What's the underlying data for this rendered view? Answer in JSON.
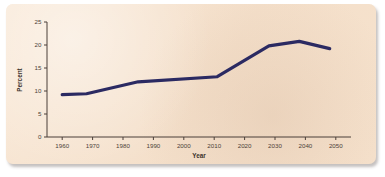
{
  "figure": {
    "background_color": "#ffffff",
    "paper_color": "#f6e2cd",
    "line_color": "#2b2a62",
    "axis_color": "#4a3f38"
  },
  "chart_data": {
    "type": "line",
    "title": "",
    "xlabel": "Year",
    "ylabel": "Percent",
    "xlim": [
      1955,
      2055
    ],
    "ylim": [
      0,
      25
    ],
    "grid": false,
    "legend": false,
    "xticks": [
      1960,
      1970,
      1980,
      1990,
      2000,
      2010,
      2020,
      2030,
      2040,
      2050
    ],
    "xtick_labels": [
      "1960",
      "1970",
      "1980",
      "1990",
      "2000",
      "2010",
      "2020",
      "2030",
      "2040",
      "2050"
    ],
    "yticks": [
      0,
      5,
      10,
      15,
      20,
      25
    ],
    "ytick_labels": [
      "0",
      "5",
      "10",
      "15",
      "20",
      "25"
    ],
    "series": [
      {
        "name": "Percent",
        "color": "#2b2a62",
        "x": [
          1960,
          1968,
          1985,
          2011,
          2028,
          2038,
          2048
        ],
        "values": [
          9.2,
          9.4,
          12.0,
          13.1,
          19.8,
          20.8,
          19.2
        ]
      }
    ]
  }
}
